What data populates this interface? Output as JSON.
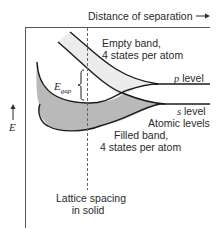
{
  "diagram": {
    "x_axis": {
      "label": "Distance of separation",
      "arrow": "right-arrow"
    },
    "y_axis": {
      "label": "E",
      "arrow": "up-arrow"
    },
    "bands": {
      "empty": {
        "line1": "Empty band,",
        "line2": "4 states per atom",
        "fill": "#ececec"
      },
      "filled": {
        "line1": "Filled band,",
        "line2": "4 states per atom",
        "fill": "#b9b9b9"
      }
    },
    "levels": {
      "p": {
        "symbol": "p",
        "word": "level"
      },
      "s": {
        "symbol": "s",
        "word": "level"
      },
      "atomic": "Atomic levels"
    },
    "gap": {
      "symbol": "E",
      "subscript": "gap"
    },
    "lattice": {
      "line1": "Lattice spacing",
      "line2": "in solid"
    },
    "colors": {
      "line": "#1a1a1a",
      "frame": "#555555",
      "dash": "#666666"
    }
  }
}
